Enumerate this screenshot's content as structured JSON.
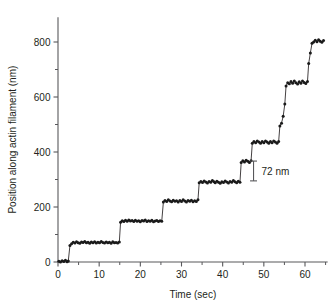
{
  "chart_data": {
    "type": "line",
    "title": "",
    "xlabel": "Time (sec)",
    "ylabel": "Position along actin filament (nm)",
    "xlim": [
      -1.5,
      65.5
    ],
    "ylim": [
      -30,
      900
    ],
    "xticks": [
      0,
      10,
      20,
      30,
      40,
      50,
      60
    ],
    "xtick_labels": [
      "0",
      "10",
      "20",
      "30",
      "40",
      "50",
      "60"
    ],
    "xminor_step": 5,
    "yticks": [
      0,
      200,
      400,
      600,
      800
    ],
    "ytick_labels": [
      "0",
      "200",
      "400",
      "600",
      "800"
    ],
    "yminor_step": 100,
    "grid": false,
    "legend": null,
    "annotations": [
      {
        "name": "scale-bar",
        "label": "72 nm",
        "value": 72,
        "units": "nm",
        "x": 47.5,
        "y_from": 295,
        "y_to": 367
      }
    ],
    "series": [
      {
        "name": "myosin V stepping trace",
        "marker": "filled-circle",
        "color": "#1a1a1a",
        "x": [
          0.2,
          0.6,
          1.0,
          1.4,
          1.8,
          2.2,
          2.5,
          2.9,
          3.3,
          3.7,
          4.1,
          4.5,
          4.9,
          5.3,
          5.7,
          6.1,
          6.5,
          6.9,
          7.3,
          7.7,
          8.1,
          8.5,
          8.9,
          9.3,
          9.7,
          10.1,
          10.5,
          10.9,
          11.3,
          11.7,
          12.1,
          12.5,
          12.9,
          13.3,
          13.7,
          14.1,
          14.5,
          14.9,
          15.2,
          15.6,
          16.0,
          16.4,
          16.8,
          17.2,
          17.6,
          18.0,
          18.4,
          18.8,
          19.2,
          19.6,
          20.0,
          20.4,
          20.8,
          21.2,
          21.6,
          22.0,
          22.4,
          22.8,
          23.2,
          23.6,
          24.0,
          24.4,
          24.8,
          25.2,
          25.6,
          26.0,
          26.4,
          26.8,
          27.2,
          27.6,
          28.0,
          28.4,
          28.8,
          29.2,
          29.6,
          30.0,
          30.4,
          30.8,
          31.2,
          31.6,
          32.0,
          32.4,
          32.8,
          33.2,
          33.6,
          34.0,
          34.3,
          34.7,
          35.1,
          35.5,
          35.9,
          36.3,
          36.7,
          37.1,
          37.5,
          37.9,
          38.2,
          38.6,
          39.0,
          39.4,
          39.8,
          40.2,
          40.6,
          41.0,
          41.4,
          41.8,
          42.2,
          42.6,
          43.0,
          43.4,
          43.8,
          44.2,
          44.5,
          44.9,
          45.3,
          45.7,
          46.1,
          46.5,
          46.9,
          47.2,
          47.6,
          48.0,
          48.4,
          48.8,
          49.2,
          49.6,
          50.0,
          50.4,
          50.8,
          51.2,
          51.6,
          52.0,
          52.4,
          52.8,
          53.2,
          53.6,
          53.9,
          54.3,
          54.7,
          55.1,
          55.4,
          55.8,
          56.2,
          56.6,
          57.0,
          57.4,
          57.8,
          58.2,
          58.6,
          59.0,
          59.4,
          59.8,
          60.2,
          60.6,
          60.9,
          61.3,
          61.7,
          62.1,
          62.5,
          62.9,
          63.3,
          63.7,
          64.1,
          64.5
        ],
        "y": [
          3,
          0,
          5,
          2,
          6,
          1,
          4,
          60,
          66,
          72,
          69,
          74,
          70,
          68,
          73,
          71,
          75,
          70,
          72,
          68,
          73,
          70,
          74,
          69,
          72,
          70,
          75,
          71,
          69,
          73,
          70,
          72,
          68,
          74,
          70,
          71,
          69,
          73,
          145,
          150,
          147,
          152,
          148,
          153,
          149,
          151,
          147,
          152,
          148,
          150,
          146,
          151,
          149,
          153,
          147,
          150,
          148,
          152,
          146,
          149,
          151,
          147,
          150,
          148,
          218,
          224,
          220,
          226,
          222,
          219,
          225,
          221,
          223,
          218,
          224,
          220,
          226,
          222,
          218,
          224,
          221,
          225,
          219,
          223,
          220,
          226,
          288,
          293,
          289,
          295,
          291,
          287,
          293,
          290,
          296,
          292,
          288,
          294,
          290,
          286,
          292,
          289,
          295,
          291,
          287,
          293,
          290,
          296,
          292,
          288,
          294,
          290,
          362,
          368,
          364,
          370,
          366,
          362,
          368,
          432,
          438,
          434,
          440,
          436,
          432,
          438,
          434,
          440,
          436,
          432,
          438,
          434,
          440,
          436,
          432,
          438,
          495,
          505,
          530,
          575,
          640,
          652,
          648,
          656,
          650,
          658,
          652,
          647,
          655,
          650,
          658,
          653,
          649,
          656,
          722,
          760,
          795,
          800,
          806,
          801,
          808,
          803,
          799,
          805
        ],
        "steps": [
          {
            "time": 2.6,
            "level": 0,
            "rise": 72
          },
          {
            "time": 15.0,
            "level": 72,
            "rise": 73
          },
          {
            "time": 25.4,
            "level": 145,
            "rise": 75
          },
          {
            "time": 34.1,
            "level": 220,
            "rise": 70
          },
          {
            "time": 38.0,
            "level": 290,
            "rise": 72
          },
          {
            "time": 44.3,
            "level": 362,
            "rise": 70
          },
          {
            "time": 47.0,
            "level": 432,
            "rise": 72
          },
          {
            "time": 53.7,
            "level": 504,
            "rise": 72
          },
          {
            "time": 55.2,
            "level": 576,
            "rise": 72
          },
          {
            "time": 60.7,
            "level": 648,
            "rise": 72
          },
          {
            "time": 61.4,
            "level": 720,
            "rise": 80
          }
        ]
      }
    ]
  },
  "figure": {
    "scalebar_label": "72 nm"
  }
}
